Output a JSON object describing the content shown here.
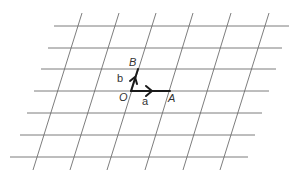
{
  "diagram": {
    "type": "oblique-lattice-grid",
    "colors": {
      "grid": "#6e6e6e",
      "vector": "#1a1a1a",
      "text": "#333333",
      "background": "#ffffff"
    },
    "horizontal_lines": [
      {
        "y": 26,
        "x1": 54,
        "x2": 289
      },
      {
        "y": 48,
        "x1": 48,
        "x2": 282
      },
      {
        "y": 69,
        "x1": 41,
        "x2": 276
      },
      {
        "y": 91,
        "x1": 34,
        "x2": 269
      },
      {
        "y": 113,
        "x1": 27,
        "x2": 262
      },
      {
        "y": 135,
        "x1": 20,
        "x2": 255
      },
      {
        "y": 157,
        "x1": 10,
        "x2": 248
      }
    ],
    "slanted_lines": [
      {
        "x1": 82,
        "y1": 13,
        "x2": 33,
        "y2": 170
      },
      {
        "x1": 119,
        "y1": 13,
        "x2": 70,
        "y2": 170
      },
      {
        "x1": 156,
        "y1": 13,
        "x2": 107,
        "y2": 170
      },
      {
        "x1": 193,
        "y1": 13,
        "x2": 145,
        "y2": 170
      },
      {
        "x1": 231,
        "y1": 13,
        "x2": 183,
        "y2": 170
      },
      {
        "x1": 269,
        "y1": 13,
        "x2": 220,
        "y2": 170
      }
    ],
    "points": {
      "O": {
        "label": "O",
        "x": 131,
        "y": 91
      },
      "A": {
        "label": "A",
        "x": 170,
        "y": 91
      },
      "B": {
        "label": "B",
        "x": 138,
        "y": 69
      }
    },
    "vectors": {
      "a": {
        "label": "a",
        "from": "O",
        "to": "A"
      },
      "b": {
        "label": "b",
        "from": "O",
        "to": "B"
      }
    },
    "labels": {
      "O": "O",
      "A": "A",
      "B": "B",
      "a": "a",
      "b": "b"
    }
  }
}
